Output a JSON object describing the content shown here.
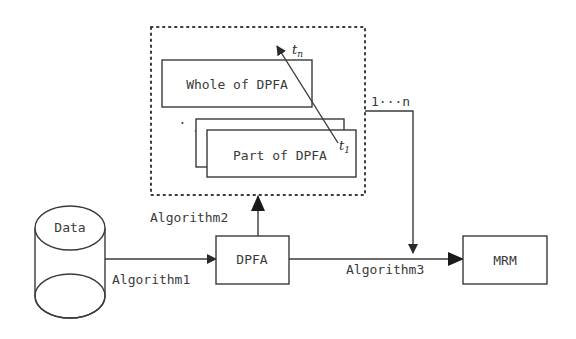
{
  "diagram": {
    "nodes": {
      "data": {
        "label": "Data",
        "shape": "cylinder"
      },
      "dpfa": {
        "label": "DPFA",
        "shape": "rectangle"
      },
      "mrm": {
        "label": "MRM",
        "shape": "rectangle"
      },
      "whole": {
        "label": "Whole of DPFA",
        "shape": "rectangle"
      },
      "part": {
        "label": "Part of DPFA",
        "shape": "stacked-rectangles"
      }
    },
    "edges": {
      "algorithm1": {
        "label": "Algorithm1",
        "from": "Data",
        "to": "DPFA"
      },
      "algorithm2": {
        "label": "Algorithm2",
        "from": "DPFA",
        "to": "DPFA group"
      },
      "algorithm3": {
        "label": "Algorithm3",
        "from": "DPFA",
        "to": "MRM"
      },
      "multi": {
        "label": "1···n",
        "from": "DPFA group",
        "to": "Algorithm3 edge"
      }
    },
    "time_arrow": {
      "start_label": "t",
      "start_sub": "1",
      "end_label": "t",
      "end_sub": "n"
    },
    "ellipsis": "· · ·",
    "colors": {
      "stroke": "#3a3a3a",
      "background": "#ffffff"
    }
  }
}
